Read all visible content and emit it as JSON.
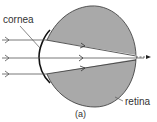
{
  "figure": {
    "labels": {
      "cornea": "cornea",
      "retina": "retina",
      "caption": "(a)"
    },
    "colors": {
      "eye_fill": "#a9a9a9",
      "lens_region": "#ffffff",
      "stroke": "#222222",
      "ray": "#555555"
    },
    "rays": [
      {
        "y": 40,
        "label": "top-ray"
      },
      {
        "y": 58,
        "label": "middle-ray"
      },
      {
        "y": 74,
        "label": "bottom-ray"
      }
    ]
  }
}
